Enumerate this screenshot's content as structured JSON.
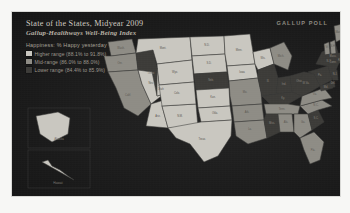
{
  "panel": {
    "title": "State of the States, Midyear 2009",
    "subtitle": "Gallup-Healthways Well-Being Index",
    "brand": "GALLUP POLL",
    "background_color": "#1d1d1d"
  },
  "legend": {
    "title": "Happiness: % Happy yesterday",
    "items": [
      {
        "label": "Higher range (88.1% to 91.8%)",
        "color": "#c9c7c0"
      },
      {
        "label": "Mid-range (86.0% to 88.0%)",
        "color": "#8e8c85"
      },
      {
        "label": "Lower range (84.4% to 85.9%)",
        "color": "#3c3b38"
      }
    ]
  },
  "insets": [
    {
      "name": "Alaska"
    },
    {
      "name": "Hawaii"
    }
  ],
  "chart_data": {
    "type": "choropleth",
    "title": "State of the States, Midyear 2009",
    "subtitle": "Gallup-Healthways Well-Being Index",
    "metric": "Happiness: % Happy yesterday",
    "units": "percent",
    "bins": [
      {
        "name": "Higher range",
        "range": [
          88.1,
          91.8
        ],
        "color": "#c9c7c0"
      },
      {
        "name": "Mid-range",
        "range": [
          86.0,
          88.0
        ],
        "color": "#8e8c85"
      },
      {
        "name": "Lower range",
        "range": [
          84.4,
          85.9
        ],
        "color": "#3c3b38"
      }
    ],
    "legend_position": "top-left",
    "states": [
      {
        "code": "WA",
        "name": "Wash.",
        "bin": "Mid-range"
      },
      {
        "code": "OR",
        "name": "Ore.",
        "bin": "Mid-range"
      },
      {
        "code": "CA",
        "name": "Calif.",
        "bin": "Mid-range"
      },
      {
        "code": "NV",
        "name": "Nev.",
        "bin": "Higher range"
      },
      {
        "code": "ID",
        "name": "Idaho",
        "bin": "Lower range"
      },
      {
        "code": "MT",
        "name": "Mont.",
        "bin": "Higher range"
      },
      {
        "code": "WY",
        "name": "Wyo.",
        "bin": "Higher range"
      },
      {
        "code": "UT",
        "name": "Utah",
        "bin": "Higher range"
      },
      {
        "code": "AZ",
        "name": "Ariz.",
        "bin": "Higher range"
      },
      {
        "code": "NM",
        "name": "N.M.",
        "bin": "Higher range"
      },
      {
        "code": "CO",
        "name": "Colo.",
        "bin": "Higher range"
      },
      {
        "code": "ND",
        "name": "N.D.",
        "bin": "Higher range"
      },
      {
        "code": "SD",
        "name": "S.D.",
        "bin": "Higher range"
      },
      {
        "code": "NE",
        "name": "Neb.",
        "bin": "Lower range"
      },
      {
        "code": "KS",
        "name": "Kan.",
        "bin": "Higher range"
      },
      {
        "code": "OK",
        "name": "Okla.",
        "bin": "Higher range"
      },
      {
        "code": "TX",
        "name": "Texas",
        "bin": "Higher range"
      },
      {
        "code": "MN",
        "name": "Minn.",
        "bin": "Higher range"
      },
      {
        "code": "IA",
        "name": "Iowa",
        "bin": "Higher range"
      },
      {
        "code": "MO",
        "name": "Mo.",
        "bin": "Mid-range"
      },
      {
        "code": "AR",
        "name": "Ark.",
        "bin": "Mid-range"
      },
      {
        "code": "LA",
        "name": "La.",
        "bin": "Mid-range"
      },
      {
        "code": "WI",
        "name": "Wis.",
        "bin": "Higher range"
      },
      {
        "code": "IL",
        "name": "Ill.",
        "bin": "Lower range"
      },
      {
        "code": "MI",
        "name": "Mich.",
        "bin": "Mid-range"
      },
      {
        "code": "IN",
        "name": "Ind.",
        "bin": "Lower range"
      },
      {
        "code": "OH",
        "name": "Ohio",
        "bin": "Lower range"
      },
      {
        "code": "KY",
        "name": "Ky.",
        "bin": "Lower range"
      },
      {
        "code": "TN",
        "name": "Tenn.",
        "bin": "Mid-range"
      },
      {
        "code": "MS",
        "name": "Miss.",
        "bin": "Lower range"
      },
      {
        "code": "AL",
        "name": "Ala.",
        "bin": "Mid-range"
      },
      {
        "code": "GA",
        "name": "Ga.",
        "bin": "Mid-range"
      },
      {
        "code": "FL",
        "name": "Fla.",
        "bin": "Mid-range"
      },
      {
        "code": "SC",
        "name": "S.C.",
        "bin": "Lower range"
      },
      {
        "code": "NC",
        "name": "N.C.",
        "bin": "Mid-range"
      },
      {
        "code": "VA",
        "name": "Va.",
        "bin": "Mid-range"
      },
      {
        "code": "WV",
        "name": "W.Va.",
        "bin": "Lower range"
      },
      {
        "code": "PA",
        "name": "Pa.",
        "bin": "Lower range"
      },
      {
        "code": "NY",
        "name": "N.Y.",
        "bin": "Lower range"
      },
      {
        "code": "ME",
        "name": "Maine",
        "bin": "Mid-range"
      },
      {
        "code": "VT",
        "name": "Vt.",
        "bin": "Mid-range"
      },
      {
        "code": "NH",
        "name": "N.H.",
        "bin": "Mid-range"
      },
      {
        "code": "MA",
        "name": "Mass.",
        "bin": "Lower range"
      },
      {
        "code": "RI",
        "name": "R.I.",
        "bin": "Lower range"
      },
      {
        "code": "CT",
        "name": "Conn.",
        "bin": "Lower range"
      },
      {
        "code": "NJ",
        "name": "N.J.",
        "bin": "Lower range"
      },
      {
        "code": "DE",
        "name": "Del.",
        "bin": "Lower range"
      },
      {
        "code": "MD",
        "name": "Md.",
        "bin": "Lower range"
      },
      {
        "code": "AK",
        "name": "Alaska",
        "bin": "Higher range"
      },
      {
        "code": "HI",
        "name": "Hawaii",
        "bin": "Higher range"
      }
    ]
  }
}
